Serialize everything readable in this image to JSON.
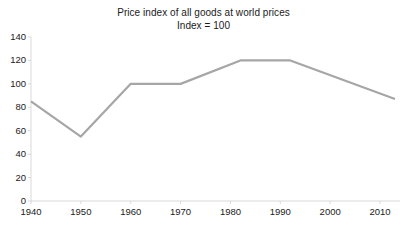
{
  "chart_data": {
    "type": "line",
    "title": "Price index of all goods at world prices",
    "subtitle": "Index = 100",
    "xlabel": "",
    "ylabel": "",
    "xlim": [
      1940,
      2014
    ],
    "ylim": [
      0,
      140
    ],
    "grid": false,
    "legend": false,
    "legend_position": "none",
    "line_color": "#a6a6a6",
    "x_ticks": [
      1940,
      1950,
      1960,
      1970,
      1980,
      1990,
      2000,
      2010
    ],
    "x_tick_labels": [
      "1940",
      "1950",
      "1960",
      "1970",
      "1980",
      "1990",
      "2000",
      "2010"
    ],
    "y_ticks": [
      0,
      20,
      40,
      60,
      80,
      100,
      120,
      140
    ],
    "y_tick_labels": [
      "0",
      "20",
      "40",
      "60",
      "80",
      "100",
      "120",
      "140"
    ],
    "series": [
      {
        "name": "Price index of all goods at world prices",
        "x": [
          1940,
          1950,
          1960,
          1970,
          1982,
          1992,
          2013
        ],
        "values": [
          85,
          55,
          100,
          100,
          120,
          120,
          87
        ]
      }
    ]
  }
}
